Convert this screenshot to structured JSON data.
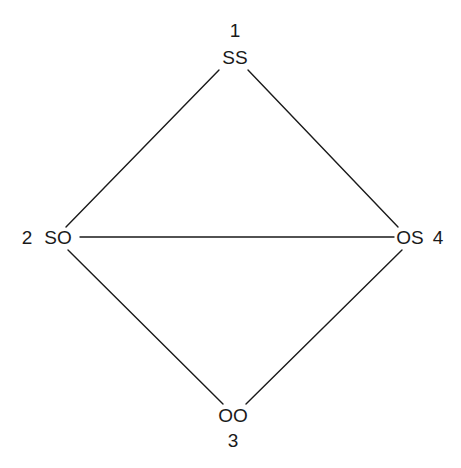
{
  "diagram": {
    "type": "graph",
    "nodes": [
      {
        "id": "n1",
        "number": "1",
        "label": "SS",
        "x": 235,
        "y": 64,
        "num_x": 235,
        "num_y": 37
      },
      {
        "id": "n2",
        "number": "2",
        "label": "SO",
        "x": 58,
        "y": 244,
        "num_x": 27,
        "num_y": 244
      },
      {
        "id": "n3",
        "number": "3",
        "label": "OO",
        "x": 233,
        "y": 422,
        "num_x": 233,
        "num_y": 447
      },
      {
        "id": "n4",
        "number": "4",
        "label": "OS",
        "x": 410,
        "y": 244,
        "num_x": 438,
        "num_y": 244
      }
    ],
    "edges": [
      {
        "from": "SS",
        "to": "SO",
        "x1": 219,
        "y1": 70,
        "x2": 66,
        "y2": 227
      },
      {
        "from": "SS",
        "to": "OS",
        "x1": 248,
        "y1": 70,
        "x2": 398,
        "y2": 227
      },
      {
        "from": "SO",
        "to": "OS",
        "x1": 80,
        "y1": 237,
        "x2": 394,
        "y2": 237
      },
      {
        "from": "SO",
        "to": "OO",
        "x1": 68,
        "y1": 250,
        "x2": 223,
        "y2": 404
      },
      {
        "from": "OS",
        "to": "OO",
        "x1": 402,
        "y1": 250,
        "x2": 246,
        "y2": 404
      }
    ]
  }
}
